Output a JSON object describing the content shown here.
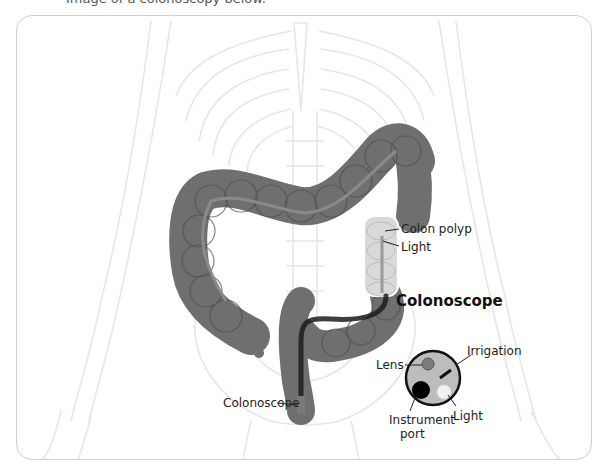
{
  "caption": {
    "text": "Image of a colonoscopy below."
  },
  "diagram": {
    "labels": {
      "colon_polyp": "Colon polyp",
      "light_inside": "Light",
      "colonoscope_tip": "Colonoscope"
    },
    "inset": {
      "title": "Colonoscope",
      "labels": {
        "lens": "Lens",
        "irrigation": "Irrigation",
        "light": "Light",
        "instrument_port_line1": "Instrument",
        "instrument_port_line2": "port"
      }
    },
    "colors": {
      "colon": "#6f6f6f",
      "colon_dark": "#4e4e4e",
      "colon_highlight": "#d9d9d9",
      "skeleton_line": "#e6e6e6",
      "scope_body": "#1c1c1c",
      "inset_face": "#bdbdbd",
      "lens": "#7c7c7c",
      "port": "#000000",
      "light": "#f2f2f2",
      "card_border": "#cfcfcf"
    }
  }
}
